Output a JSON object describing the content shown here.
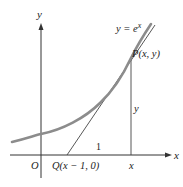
{
  "diagram": {
    "colors": {
      "axis": "#333333",
      "curve": "#8c8c8c",
      "tangent": "#444444",
      "text": "#222222",
      "background": "#ffffff"
    },
    "labels": {
      "y_axis": "y",
      "x_axis": "x",
      "curve_eq_prefix": "y = e",
      "curve_eq_exp": "x",
      "point_p": "P(x, y)",
      "vertical_len": "y",
      "base_len": "1",
      "origin": "O",
      "point_q": "Q(x − 1, 0)",
      "x_foot": "x"
    },
    "elements": {
      "curve": "y = e^x",
      "tangent_line": "through Q(x − 1, 0) and P(x, y)",
      "vertical_segment": "from P(x, y) down to (x, 0)"
    }
  }
}
